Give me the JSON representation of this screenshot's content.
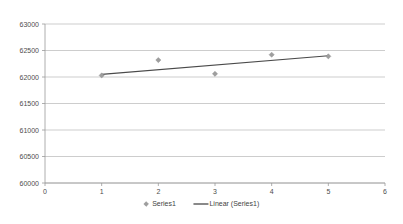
{
  "chart_data": {
    "type": "scatter",
    "title": "",
    "subtitle": "",
    "xlabel": "",
    "ylabel": "",
    "xlim": [
      0,
      6
    ],
    "ylim": [
      60000,
      63000
    ],
    "grid": true,
    "grid_axis": "y",
    "legend_position": "bottom-center",
    "x_ticks": [
      0,
      1,
      2,
      3,
      4,
      5,
      6
    ],
    "x_tick_labels": [
      "0",
      "1",
      "2",
      "3",
      "4",
      "5",
      "6"
    ],
    "y_ticks": [
      60000,
      60500,
      61000,
      61500,
      62000,
      62500,
      63000
    ],
    "y_tick_labels": [
      "60000",
      "60500",
      "61000",
      "61500",
      "62000",
      "62500",
      "63000"
    ],
    "series": [
      {
        "name": "Series1",
        "type": "scatter",
        "marker": "diamond",
        "color": "#9e9e9e",
        "x": [
          1,
          2,
          3,
          4,
          5
        ],
        "values": [
          62030,
          62320,
          62060,
          62420,
          62390
        ]
      },
      {
        "name": "Linear (Series1)",
        "type": "line",
        "color": "#4a4a4a",
        "x": [
          1,
          5
        ],
        "values": [
          62050,
          62400
        ]
      }
    ],
    "legend": [
      {
        "label": "Series1",
        "symbol": "diamond",
        "color": "#9e9e9e"
      },
      {
        "label": "Linear (Series1)",
        "symbol": "line",
        "color": "#4a4a4a"
      }
    ],
    "colors": {
      "marker": "#9e9e9e",
      "trendline": "#4a4a4a",
      "gridline": "#b7b7b7",
      "axis": "#9a9a9a",
      "tick_text": "#4d4d4d",
      "background": "#ffffff"
    }
  }
}
